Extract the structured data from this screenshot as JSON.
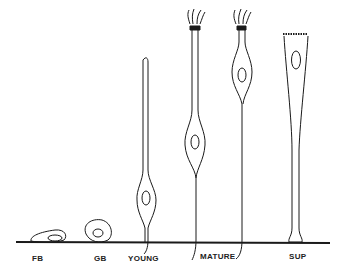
{
  "diagram": {
    "title": "",
    "labels": {
      "fb": "FB",
      "gb": "GB",
      "young": "YOUNG",
      "mature": "MATURE",
      "sup": "SUP"
    },
    "stroke_color": "#1a1a1a",
    "background": "#ffffff"
  }
}
